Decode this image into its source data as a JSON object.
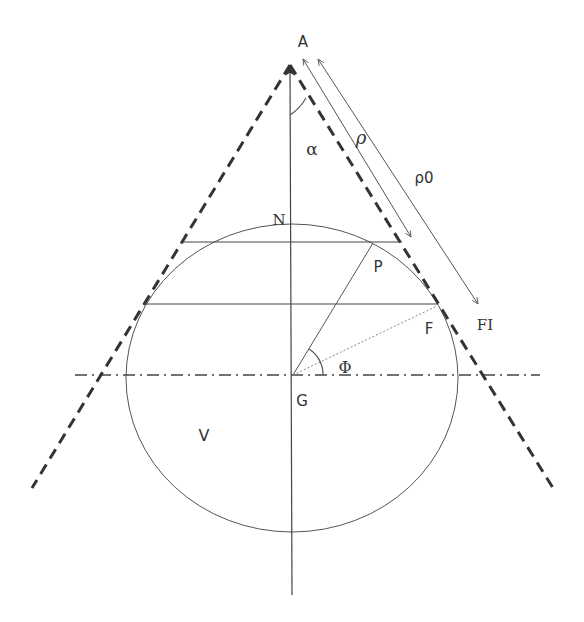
{
  "diagram": {
    "colors": {
      "background": "#ffffff",
      "line": "#444444",
      "dashed": "#333333",
      "label": "#333333"
    },
    "labels": {
      "apex": "A",
      "alpha": "α",
      "rho": "ρ",
      "rho0": "ρ0",
      "north": "N",
      "point_p": "P",
      "point_f": "F",
      "point_f_prime": "FI",
      "center": "G",
      "phi": "Φ",
      "volume": "V"
    },
    "geometry": {
      "apex": [
        290,
        65
      ],
      "center": [
        292,
        378
      ],
      "circle_rx": 166,
      "circle_ry": 154,
      "axis_top": 66,
      "axis_bottom": 595,
      "horizontal_axis": {
        "y": 375,
        "x1": 75,
        "x2": 540
      },
      "upper_chord": {
        "y": 242,
        "x1": 182,
        "x2": 402
      },
      "lower_chord": {
        "y": 304,
        "x1": 143,
        "x2": 438
      },
      "left_generatrix_end": [
        32,
        488
      ],
      "right_generatrix_end": [
        553,
        488
      ],
      "point_p": [
        373,
        243
      ],
      "point_f": [
        437,
        306
      ],
      "rho_arrow": {
        "from": [
          303,
          59
        ],
        "to": [
          411,
          237
        ]
      },
      "rho0_arrow": {
        "from": [
          318,
          59
        ],
        "to": [
          478,
          304
        ]
      }
    }
  }
}
